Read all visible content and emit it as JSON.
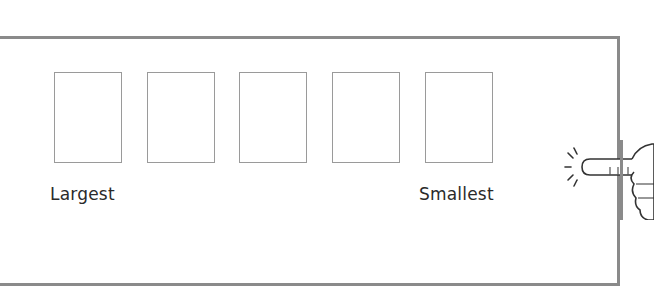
{
  "worksheet": {
    "boxes": [
      {
        "index": 1,
        "value": ""
      },
      {
        "index": 2,
        "value": ""
      },
      {
        "index": 3,
        "value": ""
      },
      {
        "index": 4,
        "value": ""
      },
      {
        "index": 5,
        "value": ""
      }
    ],
    "labels": {
      "left": "Largest",
      "right": "Smallest"
    },
    "icon": "pointing-hand-icon",
    "colors": {
      "frame": "#8a8a8a",
      "box_border": "#9a9a9a",
      "text": "#2a2a2a"
    }
  }
}
